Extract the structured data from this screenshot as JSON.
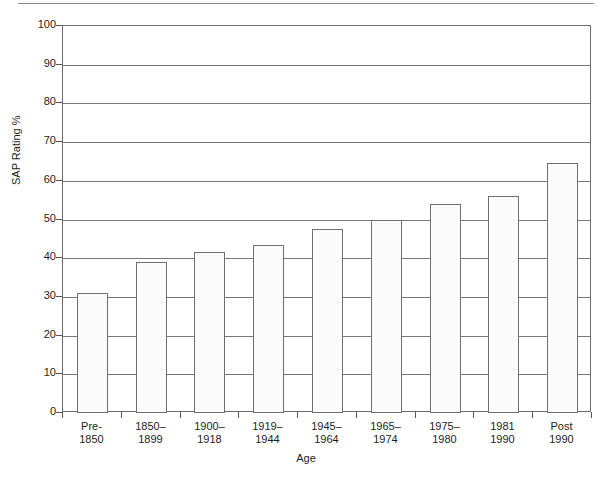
{
  "chart_data": {
    "type": "bar",
    "title": "",
    "xlabel": "Age",
    "ylabel": "SAP Rating %",
    "ylim": [
      0,
      100
    ],
    "ytick_values": [
      0,
      10,
      20,
      30,
      40,
      50,
      60,
      70,
      80,
      90,
      100
    ],
    "ytick_labels": [
      "0",
      "10",
      "20",
      "30",
      "40",
      "50",
      "60",
      "70",
      "80",
      "90",
      "100"
    ],
    "grid": true,
    "legend": "none",
    "categories": [
      "Pre-\n1850",
      "1850–\n1899",
      "1900–\n1918",
      "1919–\n1944",
      "1945–\n1964",
      "1965–\n1974",
      "1975–\n1980",
      "1981\n1990",
      "Post\n1990"
    ],
    "values": [
      31,
      39,
      41.5,
      43.5,
      47.5,
      49.8,
      54,
      56,
      64.5
    ],
    "bar_face_color": "#fbfbfb",
    "bar_edge_color": "#6f6f6f",
    "grid_color": "#777777",
    "frame_color": "#6b6b6b"
  }
}
